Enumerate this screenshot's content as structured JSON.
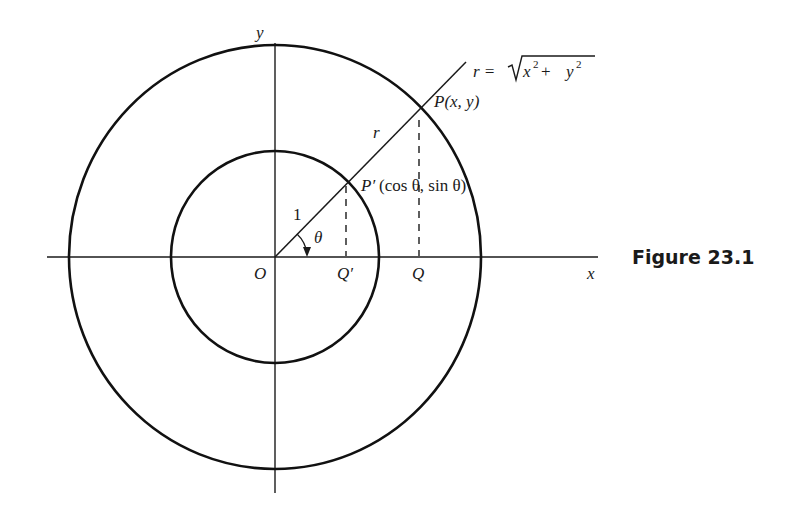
{
  "figure": {
    "caption": "Figure 23.1",
    "axes": {
      "x_label": "x",
      "y_label": "y"
    },
    "labels": {
      "origin": "O",
      "q_prime": "Q′",
      "q": "Q",
      "unit_radius": "1",
      "r": "r",
      "theta": "θ",
      "p": "P(x, y)",
      "p_prime_name": "P′",
      "p_prime_coords": "(cos θ, sin θ)",
      "r_formula_lhs": "r = ",
      "r_formula_x": "x",
      "r_formula_plus": " + ",
      "r_formula_y": "y",
      "r_formula_exp": "2"
    },
    "geometry": {
      "origin_px": [
        275,
        257
      ],
      "inner_circle_radius_px": 106,
      "outer_circle_radius_px": 208,
      "angle_deg": 45
    }
  }
}
